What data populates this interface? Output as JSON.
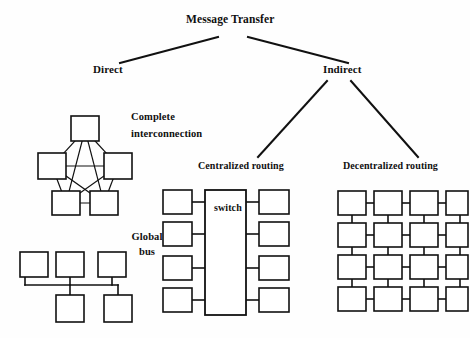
{
  "diagram": {
    "title": "Message Transfer",
    "branches": {
      "direct": "Direct",
      "indirect": "Indirect"
    },
    "labels": {
      "complete_line1": "Complete",
      "complete_line2": "interconnection",
      "global_line1": "Global",
      "global_line2": "bus",
      "centralized": "Centralized routing",
      "decentralized": "Decentralized routing",
      "switch": "switch"
    },
    "colors": {
      "stroke": "#111111",
      "background": "#ffffff",
      "text": "#101010"
    },
    "topology": {
      "complete_interconnection": {
        "node_count": 5,
        "edge_count": 10,
        "description": "fully connected pentagon"
      },
      "global_bus": {
        "top_nodes": 3,
        "bottom_nodes": 2
      },
      "centralized_routing": {
        "left_nodes": 4,
        "right_nodes": 4,
        "center": "switch"
      },
      "decentralized_routing": {
        "rows": 4,
        "cols": 4,
        "node_count": 16
      }
    }
  }
}
